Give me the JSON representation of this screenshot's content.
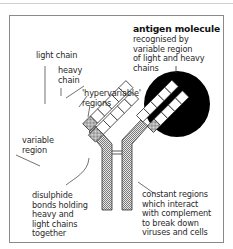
{
  "diagram": {
    "type": "antibody structure diagram",
    "labels": {
      "antigen_title": "antigen molecule",
      "antigen_desc": "recognised by\nvariable region\nof light and heavy\nchains",
      "light_chain": "light chain",
      "heavy_chain": "heavy\nchain",
      "hypervariable": "'hypervariable'\nregions",
      "variable_region": "variable\nregion",
      "disulphide": "disulphide\nbonds holding\nheavy and\nlight chains\ntogether",
      "constant_regions": "constant regions\nwhich interact\nwith complement\nto break down\nviruses and cells"
    },
    "colors": {
      "antigen_fill": "#000000",
      "outline": "#333333",
      "hatch": "#8c8c8c",
      "frame": "#8a8a8a"
    }
  }
}
